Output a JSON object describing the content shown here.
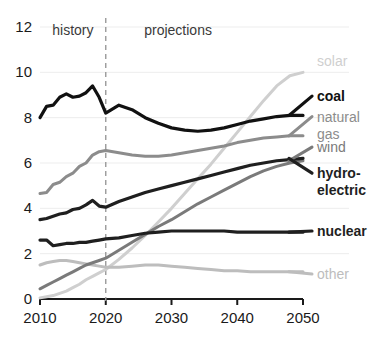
{
  "chart_data": {
    "type": "line",
    "title": "",
    "subtitle": "",
    "xlabel": "",
    "ylabel": "",
    "xlim": [
      2010,
      2050
    ],
    "ylim": [
      0,
      12
    ],
    "grid": true,
    "legend_position": "right-inline-labels",
    "x_ticks": [
      "2010",
      "2020",
      "2030",
      "2040",
      "2050"
    ],
    "y_ticks": [
      "0",
      "2",
      "4",
      "6",
      "8",
      "10",
      "12"
    ],
    "annotations": [
      {
        "name": "history",
        "text": "history",
        "x": 2015
      },
      {
        "name": "projections",
        "text": "projections",
        "x": 2031
      },
      {
        "name": "divider",
        "text": "",
        "x": 2020,
        "style": "dashed-vertical"
      }
    ],
    "x": [
      2010,
      2011,
      2012,
      2013,
      2014,
      2015,
      2016,
      2017,
      2018,
      2019,
      2020,
      2022,
      2024,
      2026,
      2028,
      2030,
      2032,
      2034,
      2036,
      2038,
      2040,
      2042,
      2044,
      2046,
      2048,
      2050
    ],
    "series": [
      {
        "name": "coal",
        "label": "coal",
        "color": "#111111",
        "bold": true,
        "label_y": 8.95,
        "values": [
          8.0,
          8.5,
          8.55,
          8.9,
          9.05,
          8.9,
          8.95,
          9.1,
          9.4,
          8.9,
          8.2,
          8.55,
          8.35,
          8.0,
          7.75,
          7.55,
          7.45,
          7.4,
          7.45,
          7.55,
          7.7,
          7.85,
          7.95,
          8.05,
          8.1,
          8.1
        ]
      },
      {
        "name": "natural-gas",
        "label": "natural",
        "label2": "gas",
        "color": "#8c8c8c",
        "bold": false,
        "label_y": 8.05,
        "values": [
          4.65,
          4.7,
          5.05,
          5.15,
          5.4,
          5.55,
          5.85,
          6.0,
          6.35,
          6.5,
          6.55,
          6.45,
          6.35,
          6.3,
          6.3,
          6.35,
          6.45,
          6.55,
          6.65,
          6.75,
          6.9,
          7.0,
          7.1,
          7.15,
          7.2,
          7.2
        ]
      },
      {
        "name": "wind",
        "label": "wind",
        "color": "#7a7a7a",
        "bold": false,
        "label_y": 6.7,
        "values": [
          0.45,
          0.6,
          0.75,
          0.9,
          1.05,
          1.2,
          1.35,
          1.5,
          1.6,
          1.7,
          1.8,
          2.15,
          2.5,
          2.85,
          3.2,
          3.5,
          3.85,
          4.2,
          4.5,
          4.8,
          5.1,
          5.4,
          5.65,
          5.85,
          6.0,
          6.1
        ]
      },
      {
        "name": "hydro-electric",
        "label": "hydro-",
        "label2": "electric",
        "color": "#1f1f1f",
        "bold": true,
        "label_y": 5.55,
        "values": [
          3.5,
          3.55,
          3.65,
          3.75,
          3.8,
          3.95,
          4.0,
          4.15,
          4.35,
          4.1,
          4.05,
          4.3,
          4.5,
          4.7,
          4.85,
          5.0,
          5.15,
          5.3,
          5.45,
          5.6,
          5.75,
          5.9,
          6.0,
          6.1,
          6.15,
          6.2
        ]
      },
      {
        "name": "nuclear",
        "label": "nuclear",
        "color": "#1f1f1f",
        "bold": true,
        "label_y": 3.0,
        "values": [
          2.6,
          2.6,
          2.35,
          2.4,
          2.45,
          2.45,
          2.5,
          2.5,
          2.55,
          2.6,
          2.65,
          2.7,
          2.8,
          2.9,
          2.95,
          3.0,
          3.0,
          3.0,
          3.0,
          3.0,
          2.95,
          2.95,
          2.95,
          2.95,
          2.95,
          2.95
        ]
      },
      {
        "name": "solar",
        "label": "solar",
        "color": "#cfcfcf",
        "bold": false,
        "label_y": 10.5,
        "values": [
          0.05,
          0.1,
          0.15,
          0.25,
          0.35,
          0.5,
          0.65,
          0.85,
          1.0,
          1.15,
          1.3,
          1.75,
          2.25,
          2.8,
          3.4,
          4.0,
          4.65,
          5.3,
          5.95,
          6.65,
          7.35,
          8.05,
          8.75,
          9.4,
          9.85,
          10.0
        ]
      },
      {
        "name": "other",
        "label": "other",
        "color": "#bdbdbd",
        "bold": false,
        "label_y": 1.1,
        "values": [
          1.5,
          1.6,
          1.65,
          1.7,
          1.7,
          1.65,
          1.6,
          1.55,
          1.5,
          1.45,
          1.4,
          1.4,
          1.45,
          1.5,
          1.5,
          1.45,
          1.4,
          1.35,
          1.3,
          1.25,
          1.25,
          1.2,
          1.2,
          1.2,
          1.2,
          1.2
        ]
      }
    ]
  }
}
